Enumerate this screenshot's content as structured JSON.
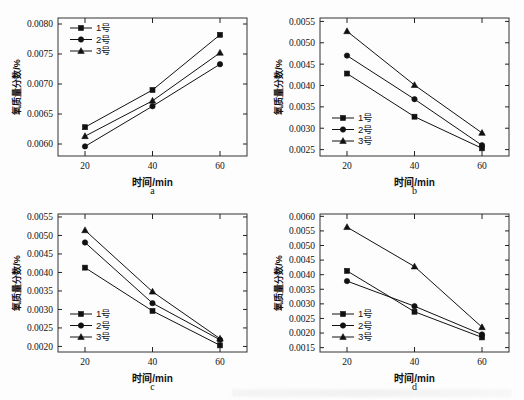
{
  "figure": {
    "background": "#fdfdfd",
    "line_color": "#111111",
    "axis_color": "#222222"
  },
  "common": {
    "xlabel": "时间/min",
    "ylabel": "氧质量分数/%",
    "xticks": [
      "20",
      "40",
      "60"
    ],
    "legend": [
      {
        "label": "1号",
        "marker": "square"
      },
      {
        "label": "2号",
        "marker": "circle"
      },
      {
        "label": "3号",
        "marker": "triangle"
      }
    ]
  },
  "chart_data": [
    {
      "type": "line",
      "panel": "a",
      "caption": "a",
      "title": "",
      "xlabel": "时间/min",
      "ylabel": "氧质量分数/%",
      "x": [
        20,
        40,
        60
      ],
      "xlim": [
        12,
        68
      ],
      "xticks": [
        20,
        40,
        60
      ],
      "xticklabels": [
        "20",
        "40",
        "60"
      ],
      "ylim": [
        0.0058,
        0.0081
      ],
      "yticks": [
        0.006,
        0.0065,
        0.007,
        0.0075,
        0.008
      ],
      "yticklabels": [
        "0.0060",
        "0.0065",
        "0.0070",
        "0.0075",
        "0.0080"
      ],
      "grid": false,
      "legend_position": "top-left",
      "series": [
        {
          "name": "1号",
          "marker": "square",
          "values": [
            0.00628,
            0.0069,
            0.00782
          ]
        },
        {
          "name": "2号",
          "marker": "circle",
          "values": [
            0.00596,
            0.00663,
            0.00733
          ]
        },
        {
          "name": "3号",
          "marker": "triangle",
          "values": [
            0.00613,
            0.00672,
            0.00752
          ]
        }
      ]
    },
    {
      "type": "line",
      "panel": "b",
      "caption": "b",
      "title": "",
      "xlabel": "时间/min",
      "ylabel": "氧质量分数/%",
      "x": [
        20,
        40,
        60
      ],
      "xlim": [
        12,
        68
      ],
      "xticks": [
        20,
        40,
        60
      ],
      "xticklabels": [
        "20",
        "40",
        "60"
      ],
      "ylim": [
        0.00235,
        0.00558
      ],
      "yticks": [
        0.0025,
        0.003,
        0.0035,
        0.004,
        0.0045,
        0.005,
        0.0055
      ],
      "yticklabels": [
        "0.0025",
        "0.0030",
        "0.0035",
        "0.0040",
        "0.0045",
        "0.0050",
        "0.0055"
      ],
      "grid": false,
      "legend_position": "bottom-left",
      "series": [
        {
          "name": "1号",
          "marker": "square",
          "values": [
            0.00428,
            0.00327,
            0.00253
          ]
        },
        {
          "name": "2号",
          "marker": "circle",
          "values": [
            0.0047,
            0.00368,
            0.0026
          ]
        },
        {
          "name": "3号",
          "marker": "triangle",
          "values": [
            0.00527,
            0.00401,
            0.00289
          ]
        }
      ]
    },
    {
      "type": "line",
      "panel": "c",
      "caption": "c",
      "title": "",
      "xlabel": "时间/min",
      "ylabel": "氧质量分数/%",
      "x": [
        20,
        40,
        60
      ],
      "xlim": [
        12,
        68
      ],
      "xticks": [
        20,
        40,
        60
      ],
      "xticklabels": [
        "20",
        "40",
        "60"
      ],
      "ylim": [
        0.00185,
        0.00558
      ],
      "yticks": [
        0.002,
        0.0025,
        0.003,
        0.0035,
        0.004,
        0.0045,
        0.005,
        0.0055
      ],
      "yticklabels": [
        "0.0020",
        "0.0025",
        "0.0030",
        "0.0035",
        "0.0040",
        "0.0045",
        "0.0050",
        "0.0055"
      ],
      "grid": false,
      "legend_position": "bottom-left",
      "series": [
        {
          "name": "1号",
          "marker": "square",
          "values": [
            0.00413,
            0.00296,
            0.00203
          ]
        },
        {
          "name": "2号",
          "marker": "circle",
          "values": [
            0.00481,
            0.00317,
            0.00218
          ]
        },
        {
          "name": "3号",
          "marker": "triangle",
          "values": [
            0.00514,
            0.00348,
            0.00221
          ]
        }
      ]
    },
    {
      "type": "line",
      "panel": "d",
      "caption": "d",
      "title": "",
      "xlabel": "时间/min",
      "ylabel": "氧质量分数/%",
      "x": [
        20,
        40,
        60
      ],
      "xlim": [
        12,
        68
      ],
      "xticks": [
        20,
        40,
        60
      ],
      "xticklabels": [
        "20",
        "40",
        "60"
      ],
      "ylim": [
        0.00135,
        0.00608
      ],
      "yticks": [
        0.0015,
        0.002,
        0.0025,
        0.003,
        0.0035,
        0.004,
        0.0045,
        0.005,
        0.0055,
        0.006
      ],
      "yticklabels": [
        "0.0015",
        "0.0020",
        "0.0025",
        "0.0030",
        "0.0035",
        "0.0040",
        "0.0045",
        "0.0050",
        "0.0055",
        "0.0060"
      ],
      "grid": false,
      "legend_position": "bottom-left",
      "series": [
        {
          "name": "1号",
          "marker": "square",
          "values": [
            0.00413,
            0.00273,
            0.00185
          ]
        },
        {
          "name": "2号",
          "marker": "circle",
          "values": [
            0.00378,
            0.00292,
            0.00195
          ]
        },
        {
          "name": "3号",
          "marker": "triangle",
          "values": [
            0.00563,
            0.00428,
            0.0022
          ]
        }
      ]
    }
  ]
}
